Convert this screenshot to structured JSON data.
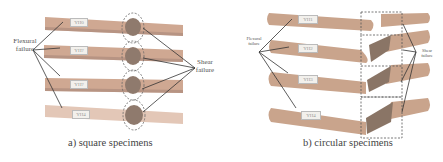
{
  "figure": {
    "panels": [
      {
        "id": "a",
        "caption": "a) square specimens",
        "left_label": "Flexural failure",
        "left_label_lines": [
          "Flexural",
          "failure"
        ],
        "right_label_lines": [
          "Shear",
          "failure"
        ],
        "specimen_tags": [
          "YH0",
          "YH?",
          "YH?",
          "YH4"
        ],
        "marker": "dashed-ellipse"
      },
      {
        "id": "b",
        "caption": "b) circular specimens",
        "left_label_lines": [
          "Flexural",
          "failure"
        ],
        "right_label_lines": [
          "Shear",
          "failure"
        ],
        "specimen_tags": [
          "YH1",
          "YH2",
          "YH3",
          "YH4"
        ],
        "marker": "dashed-rectangle"
      }
    ],
    "colors": {
      "beam": "#c9a48c",
      "beam_dark": "#a88570",
      "crack": "#7d6e62",
      "line": "#333333"
    }
  }
}
